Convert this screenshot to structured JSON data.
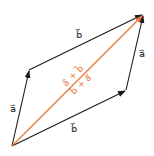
{
  "diagram": {
    "colors": {
      "edge": "#1a1a1a",
      "diagonal": "#e8743a",
      "label": "#333333"
    },
    "points": {
      "origin": [
        12,
        146
      ],
      "top_left": [
        29,
        70
      ],
      "bottom_right": [
        126,
        90
      ],
      "top_right": [
        143,
        15
      ]
    },
    "labels": {
      "top_b": "b⃗",
      "left_a": "a⃗",
      "right_a": "a⃗",
      "bottom_b": "b⃗",
      "diag_upper": "a⃗ + b⃗",
      "diag_lower": "b⃗ + a⃗"
    }
  }
}
